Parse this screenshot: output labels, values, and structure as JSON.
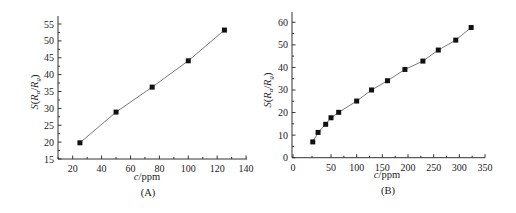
{
  "chart_data": [
    {
      "panel": "(A)",
      "type": "line",
      "marker": "square",
      "xlabel_italic": "c",
      "xlabel_rest": "/ppm",
      "ylabel": "S(Ra/Rg)",
      "ylabel_parts": {
        "s": "S(",
        "r1": "R",
        "sub1": "a",
        "slash": "/",
        "r2": "R",
        "sub2": "g",
        "close": ")"
      },
      "xlim": [
        10,
        140
      ],
      "ylim": [
        15,
        57
      ],
      "xticks": [
        20,
        40,
        60,
        80,
        100,
        120,
        140
      ],
      "yticks": [
        15,
        20,
        25,
        30,
        35,
        40,
        45,
        50,
        55
      ],
      "x": [
        25,
        50,
        75,
        100,
        125
      ],
      "y": [
        19.8,
        28.9,
        36.3,
        44.1,
        53.2
      ],
      "grid": false,
      "legend": null
    },
    {
      "panel": "(B)",
      "type": "line",
      "marker": "square",
      "xlabel_italic": "c",
      "xlabel_rest": "/ppm",
      "ylabel": "S(Ra/Rg)",
      "ylabel_parts": {
        "s": "S(",
        "r1": "R",
        "sub1": "a",
        "slash": "/",
        "r2": "R",
        "sub2": "g",
        "close": ")"
      },
      "xlim": [
        0,
        350
      ],
      "ylim": [
        0,
        65
      ],
      "xticks": [
        0,
        50,
        100,
        150,
        200,
        250,
        300,
        350
      ],
      "yticks": [
        0,
        10,
        20,
        30,
        40,
        50,
        60
      ],
      "x": [
        26,
        33,
        43,
        50,
        65,
        100,
        129,
        160,
        194,
        229,
        259,
        293,
        323
      ],
      "y": [
        7.0,
        11.2,
        14.8,
        17.7,
        20.1,
        25.1,
        30.0,
        34.1,
        39.1,
        42.8,
        47.7,
        52.1,
        57.7
      ],
      "grid": false,
      "legend": null
    }
  ],
  "colors": {
    "line": "#7a7a7a",
    "marker": "#111111",
    "axis": "#333333"
  }
}
